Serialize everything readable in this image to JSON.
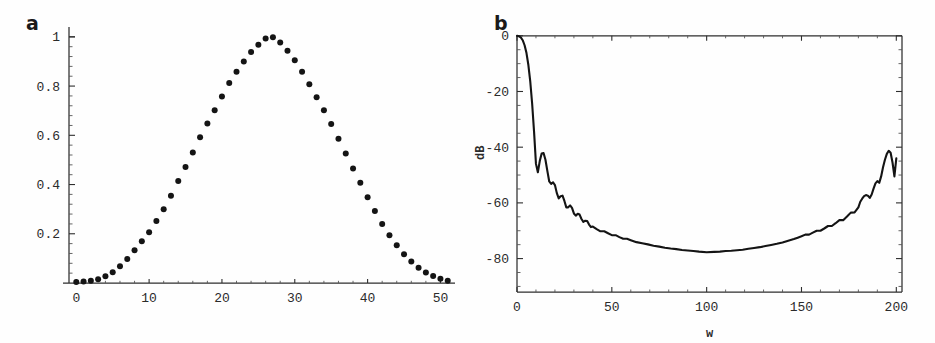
{
  "figure": {
    "background_color": "#fefefe",
    "ink_color": "#141414"
  },
  "panels": [
    {
      "id": "a",
      "label": "a",
      "xlabel": "",
      "ylabel": ""
    },
    {
      "id": "b",
      "label": "b",
      "xlabel": "w",
      "ylabel": "dB"
    }
  ],
  "chart_data": [
    {
      "type": "scatter",
      "panel": "a",
      "title": "",
      "xlabel": "",
      "ylabel": "",
      "xlim": [
        -1,
        52
      ],
      "ylim": [
        0,
        1.04
      ],
      "xticks": [
        0,
        10,
        20,
        30,
        40,
        50
      ],
      "xtick_labels": [
        "0",
        "10",
        "20",
        "30",
        "40",
        "50"
      ],
      "yticks": [
        0.2,
        0.4,
        0.6,
        0.8,
        1
      ],
      "ytick_labels": [
        "0.2",
        "0.4",
        "0.6",
        "0.8",
        "1"
      ],
      "minor_xticks_per_interval": 5,
      "minor_yticks_per_interval": 5,
      "grid": false,
      "legend": false,
      "marker": "filled-circle",
      "marker_size_px": 4.2,
      "x": [
        0,
        1,
        2,
        3,
        4,
        5,
        6,
        7,
        8,
        9,
        10,
        11,
        12,
        13,
        14,
        15,
        16,
        17,
        18,
        19,
        20,
        21,
        22,
        23,
        24,
        25,
        26,
        27,
        28,
        29,
        30,
        31,
        32,
        33,
        34,
        35,
        36,
        37,
        38,
        39,
        40,
        41,
        42,
        43,
        44,
        45,
        46,
        47,
        48,
        49,
        50,
        51
      ],
      "y": [
        0.004,
        0.006,
        0.009,
        0.015,
        0.027,
        0.044,
        0.068,
        0.098,
        0.133,
        0.17,
        0.206,
        0.252,
        0.3,
        0.354,
        0.414,
        0.471,
        0.53,
        0.592,
        0.648,
        0.702,
        0.758,
        0.812,
        0.858,
        0.9,
        0.938,
        0.968,
        0.993,
        0.998,
        0.977,
        0.944,
        0.905,
        0.858,
        0.807,
        0.755,
        0.702,
        0.646,
        0.586,
        0.526,
        0.465,
        0.407,
        0.348,
        0.292,
        0.24,
        0.194,
        0.153,
        0.117,
        0.087,
        0.062,
        0.043,
        0.028,
        0.017,
        0.009
      ]
    },
    {
      "type": "line",
      "panel": "b",
      "title": "",
      "xlabel": "w",
      "ylabel": "dB",
      "xlim": [
        0,
        203
      ],
      "ylim": [
        -92,
        1
      ],
      "xticks": [
        0,
        50,
        100,
        150,
        200
      ],
      "xtick_labels": [
        "0",
        "50",
        "100",
        "150",
        "200"
      ],
      "yticks": [
        0,
        -20,
        -40,
        -60,
        -80
      ],
      "ytick_labels": [
        "0",
        "-20",
        "-40",
        "-60",
        "-80"
      ],
      "minor_xticks_per_interval": 5,
      "minor_yticks_per_interval": 4,
      "grid": false,
      "legend": false,
      "mainlobe_edge_w": 11,
      "peak_sidelobe_db": -42,
      "floor_db": -78,
      "x": [
        0,
        1,
        2,
        3,
        4,
        5,
        6,
        7,
        8,
        9,
        10,
        11,
        12,
        13,
        14,
        15,
        16,
        17,
        18,
        19,
        20,
        21,
        22,
        23,
        24,
        25,
        26,
        27,
        28,
        29,
        30,
        31,
        32,
        33,
        34,
        35,
        36,
        37,
        38,
        39,
        40,
        42,
        44,
        46,
        48,
        50,
        52,
        54,
        56,
        58,
        60,
        63,
        66,
        69,
        72,
        75,
        78,
        81,
        84,
        87,
        90,
        93,
        96,
        100,
        104,
        107,
        110,
        113,
        116,
        119,
        122,
        125,
        128,
        131,
        134,
        137,
        140,
        143,
        146,
        148,
        150,
        152,
        154,
        156,
        158,
        160,
        162,
        164,
        166,
        168,
        170,
        172,
        174,
        176,
        178,
        180,
        181,
        182,
        183,
        184,
        185,
        186,
        187,
        188,
        189,
        190,
        191,
        192,
        193,
        194,
        195,
        196,
        197,
        198,
        199,
        200
      ],
      "y": [
        0,
        -0.2,
        -0.6,
        -1.6,
        -3.4,
        -6.2,
        -10.5,
        -16.5,
        -24.5,
        -34.5,
        -46,
        -49,
        -45,
        -42.3,
        -42.1,
        -44.5,
        -48.5,
        -52.3,
        -53.2,
        -52.6,
        -53.6,
        -56.5,
        -58.4,
        -57.6,
        -57.4,
        -59.3,
        -61.6,
        -61.6,
        -60.9,
        -61.8,
        -63.8,
        -64.6,
        -63.9,
        -64.2,
        -65.8,
        -66.8,
        -66.4,
        -66.5,
        -67.8,
        -68.7,
        -68.5,
        -69.4,
        -70.2,
        -70.2,
        -70.9,
        -71.6,
        -71.6,
        -72.3,
        -72.9,
        -72.9,
        -73.4,
        -74.1,
        -74.5,
        -74.9,
        -75.4,
        -75.7,
        -76.1,
        -76.4,
        -76.6,
        -76.9,
        -77.1,
        -77.3,
        -77.5,
        -77.7,
        -77.6,
        -77.5,
        -77.3,
        -77.2,
        -77.0,
        -76.8,
        -76.5,
        -76.2,
        -75.9,
        -75.5,
        -75.1,
        -74.7,
        -74.2,
        -73.6,
        -73.0,
        -72.5,
        -72.0,
        -71.4,
        -71.4,
        -70.7,
        -70.0,
        -70.0,
        -69.2,
        -68.3,
        -68.3,
        -67.3,
        -66.2,
        -66.2,
        -64.9,
        -63.5,
        -63.4,
        -61.6,
        -59.6,
        -58.5,
        -57.6,
        -57.2,
        -57.4,
        -58.2,
        -57.0,
        -54.9,
        -53.0,
        -52.2,
        -52.8,
        -50.5,
        -47.2,
        -44.5,
        -42.4,
        -41.3,
        -42.0,
        -45.5,
        -50.5,
        -44,
        -20,
        -3,
        0
      ]
    }
  ]
}
